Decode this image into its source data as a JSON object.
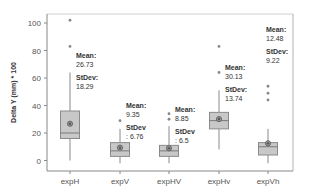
{
  "chart_data": {
    "type": "box",
    "title": "",
    "xlabel": "",
    "ylabel": "Delta Y (mm) * 100",
    "ylim": [
      -5,
      105
    ],
    "yticks": [
      0,
      20,
      40,
      60,
      80,
      100
    ],
    "grid": false,
    "legend": null,
    "categories": [
      "expH",
      "expV",
      "expHV",
      "expHv",
      "expVh"
    ],
    "boxes": [
      {
        "name": "expH",
        "whisker_low": 0,
        "q1": 16,
        "median": 20,
        "q3": 36,
        "whisker_high": 64,
        "mean": 26.73,
        "stdev": 18.29,
        "outliers": [
          83,
          102
        ]
      },
      {
        "name": "expV",
        "whisker_low": -2,
        "q1": 3,
        "median": 7,
        "q3": 13,
        "whisker_high": 23,
        "mean": 9.35,
        "stdev": 6.76,
        "outliers": [
          29
        ]
      },
      {
        "name": "expHV",
        "whisker_low": -2,
        "q1": 3,
        "median": 7,
        "q3": 11,
        "whisker_high": 25,
        "mean": 8.85,
        "stdev": 6.5,
        "outliers": [
          30,
          34
        ]
      },
      {
        "name": "expHv",
        "whisker_low": 8,
        "q1": 23,
        "median": 29,
        "q3": 35,
        "whisker_high": 51,
        "mean": 30.13,
        "stdev": 13.74,
        "outliers": [
          64,
          83
        ]
      },
      {
        "name": "expVh",
        "whisker_low": -2,
        "q1": 4,
        "median": 10,
        "q3": 13,
        "whisker_high": 23,
        "mean": 12.48,
        "stdev": 9.22,
        "outliers": [
          44,
          49,
          54
        ]
      }
    ],
    "annotations": [
      {
        "target": "expH",
        "lines": [
          "Mean:",
          "26.73",
          "StDev:",
          "18.29"
        ]
      },
      {
        "target": "expV",
        "lines": [
          "Mean:",
          "9.35",
          "StDev",
          ": 6.76"
        ]
      },
      {
        "target": "expHV",
        "lines": [
          "Mean:",
          "8.85",
          "StDev",
          ": 6.5"
        ]
      },
      {
        "target": "expHv",
        "lines": [
          "Mean:",
          "30.13",
          "StDev:",
          "13.74"
        ]
      },
      {
        "target": "expVh",
        "lines": [
          "Mean:",
          "12.48",
          "StDev:",
          "9.22"
        ]
      }
    ],
    "colors": {
      "box_fill": "#c8c8c8",
      "box_stroke": "#8a8a8a",
      "median": "#7a7a7a",
      "mean_dot": "#555555",
      "axis": "#888888",
      "text": "#333333"
    }
  }
}
